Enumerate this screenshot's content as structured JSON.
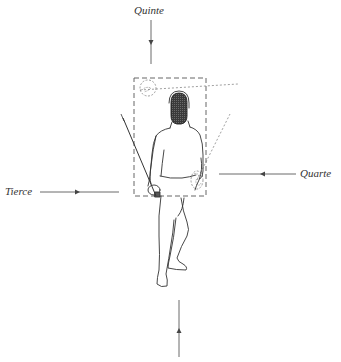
{
  "diagram": {
    "type": "fencing-target-lines",
    "labels": {
      "top": "Quinte",
      "left": "Tierce",
      "right": "Quarte",
      "bottom": ""
    },
    "target_box": {
      "x": 134,
      "y": 78,
      "width": 72,
      "height": 118,
      "style": "dashed"
    },
    "arrows": [
      {
        "name": "quinte-arrow",
        "from": [
          151,
          17
        ],
        "to": [
          151,
          64
        ],
        "direction": "down"
      },
      {
        "name": "tierce-arrow",
        "from": [
          40,
          192
        ],
        "to": [
          119,
          192
        ],
        "direction": "right"
      },
      {
        "name": "quarte-arrow",
        "from": [
          296,
          174
        ],
        "to": [
          219,
          174
        ],
        "direction": "left"
      },
      {
        "name": "bottom-arrow",
        "from": [
          179,
          357
        ],
        "to": [
          179,
          300
        ],
        "direction": "up"
      }
    ],
    "colors": {
      "line": "#444444",
      "dashed": "#666666",
      "mask": "#3a3a3a",
      "text": "#333333",
      "background": "#ffffff"
    }
  }
}
